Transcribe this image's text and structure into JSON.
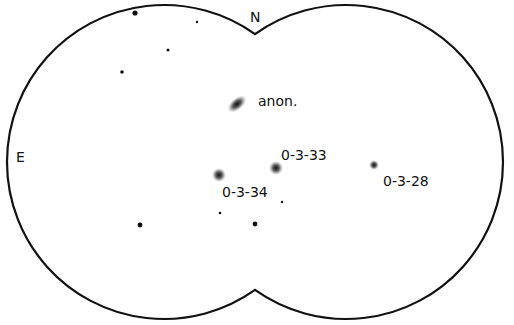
{
  "field": {
    "outline_color": "#111111",
    "directions": {
      "north": "N",
      "east": "E"
    },
    "circles": [
      {
        "cx": 164,
        "cy": 162,
        "r": 157
      },
      {
        "cx": 346,
        "cy": 162,
        "r": 157
      }
    ]
  },
  "galaxies": [
    {
      "id": "anon",
      "label": "anon.",
      "x": 237,
      "y": 104,
      "label_x": 258,
      "label_y": 106,
      "rx": 9,
      "ry": 4,
      "rot": -40
    },
    {
      "id": "0-3-33",
      "label": "0-3-33",
      "x": 276,
      "y": 168,
      "label_x": 281,
      "label_y": 160,
      "rx": 5,
      "ry": 5,
      "rot": 0
    },
    {
      "id": "0-3-34",
      "label": "0-3-34",
      "x": 219,
      "y": 175,
      "label_x": 222,
      "label_y": 197,
      "rx": 5,
      "ry": 5,
      "rot": 0
    },
    {
      "id": "0-3-28",
      "label": "0-3-28",
      "x": 374,
      "y": 165,
      "label_x": 383,
      "label_y": 186,
      "rx": 3,
      "ry": 3,
      "rot": 0
    }
  ],
  "stars": [
    {
      "x": 135,
      "y": 13,
      "r": 2.6
    },
    {
      "x": 197,
      "y": 22,
      "r": 1.2
    },
    {
      "x": 168,
      "y": 50,
      "r": 1.5
    },
    {
      "x": 122,
      "y": 72,
      "r": 1.8
    },
    {
      "x": 282,
      "y": 202,
      "r": 1.2
    },
    {
      "x": 220,
      "y": 213,
      "r": 1.3
    },
    {
      "x": 140,
      "y": 225,
      "r": 2.4
    },
    {
      "x": 255,
      "y": 224,
      "r": 2.4
    }
  ]
}
